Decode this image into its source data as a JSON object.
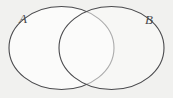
{
  "figure": {
    "type": "venn-diagram",
    "background_color": "#f1f1ef",
    "stroke_color": "#4a4a4d",
    "fill_color": "#fbfbfa",
    "stroke_width": 1.1
  },
  "labels": {
    "set_a": "A",
    "set_b": "B"
  },
  "sets": [
    {
      "name": "A",
      "label": "A",
      "shape": "ellipse",
      "cx": 61.5,
      "cy": 48,
      "rx": 52.5,
      "ry": 41.5,
      "label_x": 19,
      "label_y": 12
    },
    {
      "name": "B",
      "label": "B",
      "shape": "ellipse",
      "cx": 111.5,
      "cy": 48,
      "rx": 52.5,
      "ry": 41.5,
      "label_x": 145,
      "label_y": 13
    }
  ],
  "intersections": [
    {
      "name": "upper-crossing",
      "x": 87,
      "y": 10
    },
    {
      "name": "lower-crossing",
      "x": 87,
      "y": 82
    }
  ]
}
